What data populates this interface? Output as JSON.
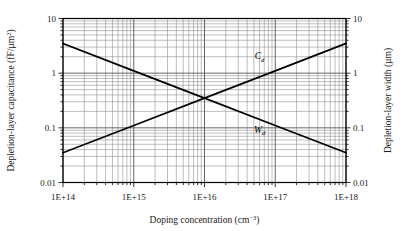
{
  "chart_data": {
    "type": "line",
    "title": "",
    "xlabel": "Doping concentration (cm−3)",
    "ylabel": "Depletion-layer capacitance (fF/µm²)",
    "y2label": "Depletion-layer width (µm)",
    "xscale": "log",
    "yscale": "log",
    "y2scale": "log",
    "xlim": [
      100000000000000.0,
      1e+18
    ],
    "ylim": [
      0.01,
      10
    ],
    "y2lim": [
      0.01,
      10
    ],
    "grid": "major-and-minor-log",
    "legend": "inline-annotations",
    "xticks": [
      {
        "value": 100000000000000.0,
        "label": "1E+14"
      },
      {
        "value": 1000000000000000.0,
        "label": "1E+15"
      },
      {
        "value": 1e+16,
        "label": "1E+16"
      },
      {
        "value": 1e+17,
        "label": "1E+17"
      },
      {
        "value": 1e+18,
        "label": "1E+18"
      }
    ],
    "yticks": [
      {
        "value": 10,
        "label": "10"
      },
      {
        "value": 1,
        "label": "1"
      },
      {
        "value": 0.1,
        "label": "0.1"
      },
      {
        "value": 0.01,
        "label": "0.01"
      }
    ],
    "y2ticks": [
      {
        "value": 10,
        "label": "10"
      },
      {
        "value": 1,
        "label": "1"
      },
      {
        "value": 0.1,
        "label": "0.1"
      },
      {
        "value": 0.01,
        "label": "0.01"
      }
    ],
    "series": [
      {
        "name": "Cd",
        "label_main": "C",
        "label_sub": "d",
        "axis": "left",
        "units": "fF/µm²",
        "description": "Depletion-layer capacitance vs doping concentration (decreasing)",
        "x": [
          100000000000000.0,
          1000000000000000.0,
          1e+16,
          1e+17,
          1e+18
        ],
        "y": [
          3.5,
          1.1,
          0.35,
          0.11,
          0.035
        ],
        "annotation": {
          "x": 6e+16,
          "y": 1.8
        }
      },
      {
        "name": "Wd",
        "label_main": "W",
        "label_sub": "d",
        "axis": "right",
        "units": "µm",
        "description": "Depletion-layer width vs doping concentration (increasing)",
        "x": [
          100000000000000.0,
          1000000000000000.0,
          1e+16,
          1e+17,
          1e+18
        ],
        "y": [
          0.035,
          0.11,
          0.35,
          1.1,
          3.5
        ],
        "annotation": {
          "x": 6e+16,
          "y": 0.082
        }
      }
    ],
    "colors": {
      "curve": "#000000",
      "major_grid": "#555555",
      "minor_grid": "#888888",
      "frame": "#000000",
      "background": "#ffffff",
      "text": "#1a1a1a"
    }
  },
  "axes": {
    "x_title": "Doping concentration (cm",
    "x_title_sup": "−3",
    "x_title_tail": ")",
    "y_left_title": "Depletion-layer capacitance (fF/µm",
    "y_left_title_sup": "2",
    "y_left_title_tail": ")",
    "y_right_title": "Depletion-layer width (µm)"
  }
}
